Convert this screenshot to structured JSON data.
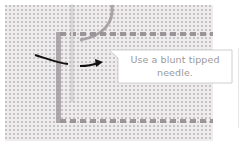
{
  "image": {
    "subject": "embroidery-canvas-photo",
    "description": "Close-up photo of evenweave canvas with running stitch outline, a needle, and instructional arrows",
    "colors": {
      "canvas": "#ecebea",
      "grid_hole": "#b9b7b8",
      "thread": "#8f878c",
      "needle": "#d6d6d6",
      "arrow": "#111111",
      "callout_border": "#cfcfcf",
      "callout_bg": "#ffffff",
      "callout_text": "#9a9a9a"
    }
  },
  "callout": {
    "lines": [
      "Use a blunt tipped",
      "needle."
    ]
  },
  "annotations": {
    "arrows": [
      {
        "name": "curved-arrow-left",
        "direction": "toward-needle"
      },
      {
        "name": "arrow-right",
        "direction": "away-from-needle"
      }
    ]
  }
}
